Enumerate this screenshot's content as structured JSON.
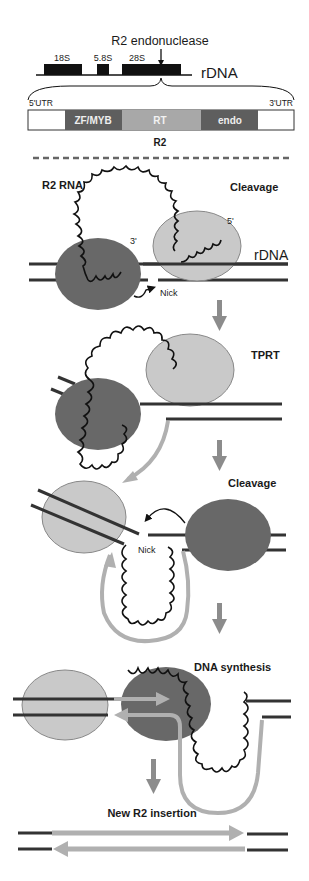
{
  "header": {
    "endonuclease_label": "R2 endonuclease",
    "rdna_label": "rDNA",
    "genes": [
      {
        "label": "18S"
      },
      {
        "label": "5.8S"
      },
      {
        "label": "28S"
      }
    ]
  },
  "r2_element": {
    "name": "R2",
    "utr5": "5'UTR",
    "utr3": "3'UTR",
    "domains": [
      {
        "label": "ZF/MYB",
        "color": "#606060"
      },
      {
        "label": "RT",
        "color": "#a8a8a8"
      },
      {
        "label": "endo",
        "color": "#606060"
      }
    ]
  },
  "steps": [
    {
      "title": "Cleavage",
      "labels": {
        "rna": "R2 RNA",
        "three_prime": "3'",
        "five_prime": "5'",
        "rdna": "rDNA",
        "nick": "Nick"
      }
    },
    {
      "title": "TPRT"
    },
    {
      "title": "Cleavage",
      "labels": {
        "nick": "Nick"
      }
    },
    {
      "title": "DNA synthesis"
    },
    {
      "title": "New R2 insertion"
    }
  ],
  "colors": {
    "dark_protein": "#6a6a6a",
    "light_protein": "#c8c8c8",
    "dna": "#333333",
    "cdna": "#b0b0b0",
    "arrow": "#8c8c8c"
  }
}
